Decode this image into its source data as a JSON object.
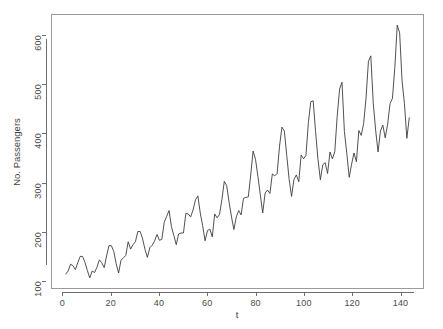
{
  "chart_data": {
    "type": "line",
    "title": "",
    "xlabel": "t",
    "ylabel": "No. Passengers",
    "xlim": [
      1,
      144
    ],
    "ylim": [
      104,
      622
    ],
    "grid": false,
    "legend": null,
    "line_color": "#3c3c3c",
    "box_color": "#9a9a9a",
    "background": "#ffffff",
    "x_ticks": [
      0,
      20,
      40,
      60,
      80,
      100,
      120,
      140
    ],
    "y_ticks": [
      100,
      200,
      300,
      400,
      500,
      600
    ],
    "x_tick_labels": [
      "0",
      "20",
      "40",
      "60",
      "80",
      "100",
      "120",
      "140"
    ],
    "y_tick_labels": [
      "100",
      "200",
      "300",
      "400",
      "500",
      "600"
    ],
    "n_points": 144,
    "x": [
      1,
      2,
      3,
      4,
      5,
      6,
      7,
      8,
      9,
      10,
      11,
      12,
      13,
      14,
      15,
      16,
      17,
      18,
      19,
      20,
      21,
      22,
      23,
      24,
      25,
      26,
      27,
      28,
      29,
      30,
      31,
      32,
      33,
      34,
      35,
      36,
      37,
      38,
      39,
      40,
      41,
      42,
      43,
      44,
      45,
      46,
      47,
      48,
      49,
      50,
      51,
      52,
      53,
      54,
      55,
      56,
      57,
      58,
      59,
      60,
      61,
      62,
      63,
      64,
      65,
      66,
      67,
      68,
      69,
      70,
      71,
      72,
      73,
      74,
      75,
      76,
      77,
      78,
      79,
      80,
      81,
      82,
      83,
      84,
      85,
      86,
      87,
      88,
      89,
      90,
      91,
      92,
      93,
      94,
      95,
      96,
      97,
      98,
      99,
      100,
      101,
      102,
      103,
      104,
      105,
      106,
      107,
      108,
      109,
      110,
      111,
      112,
      113,
      114,
      115,
      116,
      117,
      118,
      119,
      120,
      121,
      122,
      123,
      124,
      125,
      126,
      127,
      128,
      129,
      130,
      131,
      132,
      133,
      134,
      135,
      136,
      137,
      138,
      139,
      140,
      141,
      142,
      143,
      144
    ],
    "values": [
      112,
      118,
      132,
      129,
      121,
      135,
      148,
      148,
      136,
      119,
      104,
      118,
      115,
      126,
      141,
      135,
      125,
      149,
      170,
      170,
      158,
      133,
      114,
      140,
      145,
      150,
      178,
      163,
      172,
      178,
      199,
      199,
      184,
      162,
      146,
      166,
      171,
      180,
      193,
      181,
      183,
      218,
      230,
      242,
      209,
      191,
      172,
      194,
      196,
      196,
      236,
      235,
      229,
      243,
      264,
      272,
      237,
      211,
      180,
      201,
      204,
      188,
      235,
      227,
      234,
      264,
      302,
      293,
      259,
      229,
      203,
      229,
      242,
      233,
      267,
      269,
      270,
      315,
      364,
      347,
      312,
      274,
      237,
      278,
      284,
      277,
      317,
      313,
      318,
      374,
      413,
      405,
      355,
      306,
      271,
      306,
      315,
      301,
      356,
      348,
      355,
      422,
      465,
      467,
      404,
      347,
      305,
      336,
      340,
      318,
      362,
      348,
      363,
      435,
      491,
      505,
      404,
      359,
      310,
      337,
      360,
      342,
      406,
      396,
      420,
      472,
      548,
      559,
      463,
      407,
      362,
      405,
      417,
      391,
      419,
      461,
      472,
      535,
      622,
      606,
      508,
      461,
      390,
      432
    ]
  },
  "figure": {
    "width": 443,
    "height": 329
  }
}
